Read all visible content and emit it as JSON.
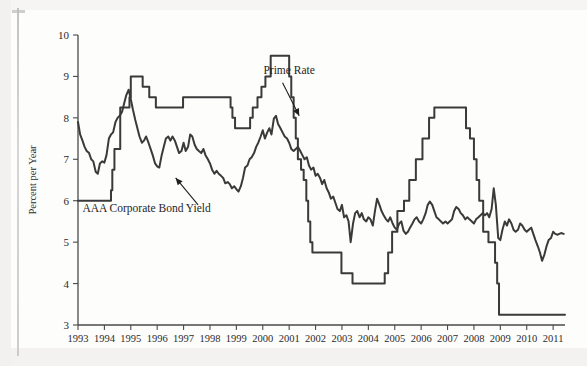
{
  "figure": {
    "background_color": "#fdfdfc",
    "line_color": "#3a3a3a",
    "axis_color": "#4a4a4a"
  },
  "annotations": [
    {
      "name": "prime-rate",
      "text": "Prime Rate",
      "x": 2001.0,
      "y": 9.05
    },
    {
      "name": "aaa-corporate-bond-yield",
      "text": "AAA Corporate Bond Yield",
      "x": 1995.6,
      "y": 5.72
    }
  ],
  "chart_data": {
    "type": "line",
    "title": "",
    "xlabel": "",
    "ylabel": "Percent per Year",
    "xlim": [
      1993.0,
      2011.45
    ],
    "ylim": [
      3,
      10
    ],
    "yticks": [
      3,
      4,
      5,
      6,
      7,
      8,
      9,
      10
    ],
    "xticks": [
      1993,
      1994,
      1995,
      1996,
      1997,
      1998,
      1999,
      2000,
      2001,
      2002,
      2003,
      2004,
      2005,
      2006,
      2007,
      2008,
      2009,
      2010,
      2011
    ],
    "xtick_labels": [
      "1993",
      "1994",
      "1995",
      "1996",
      "1997",
      "1998",
      "1999",
      "2000",
      "2001",
      "2002",
      "2003",
      "2004",
      "2005",
      "2006",
      "2007",
      "2008",
      "2009",
      "2010",
      "2011"
    ],
    "ytick_labels": [
      "3",
      "4",
      "5",
      "6",
      "7",
      "8",
      "9",
      "10"
    ],
    "grid": false,
    "legend_position": "none",
    "series": [
      {
        "name": "Prime Rate",
        "color": "#3a3a3a",
        "step": true,
        "points": [
          [
            1993.0,
            6.0
          ],
          [
            1994.2,
            6.0
          ],
          [
            1994.25,
            6.25
          ],
          [
            1994.3,
            6.75
          ],
          [
            1994.38,
            7.25
          ],
          [
            1994.55,
            7.25
          ],
          [
            1994.6,
            8.25
          ],
          [
            1994.8,
            8.25
          ],
          [
            1994.95,
            8.5
          ],
          [
            1995.0,
            9.0
          ],
          [
            1995.38,
            9.0
          ],
          [
            1995.45,
            8.75
          ],
          [
            1995.6,
            8.75
          ],
          [
            1995.7,
            8.5
          ],
          [
            1995.85,
            8.5
          ],
          [
            1995.95,
            8.25
          ],
          [
            1996.9,
            8.25
          ],
          [
            1996.98,
            8.5
          ],
          [
            1998.7,
            8.5
          ],
          [
            1998.78,
            8.25
          ],
          [
            1998.85,
            8.0
          ],
          [
            1998.95,
            7.75
          ],
          [
            1999.45,
            7.75
          ],
          [
            1999.52,
            8.0
          ],
          [
            1999.62,
            8.25
          ],
          [
            1999.8,
            8.5
          ],
          [
            1999.95,
            8.75
          ],
          [
            2000.1,
            9.0
          ],
          [
            2000.3,
            9.5
          ],
          [
            2000.42,
            9.5
          ],
          [
            2000.9,
            9.5
          ],
          [
            2001.0,
            9.0
          ],
          [
            2001.08,
            8.5
          ],
          [
            2001.17,
            8.0
          ],
          [
            2001.25,
            7.5
          ],
          [
            2001.33,
            7.0
          ],
          [
            2001.45,
            6.75
          ],
          [
            2001.55,
            6.5
          ],
          [
            2001.65,
            6.0
          ],
          [
            2001.72,
            5.5
          ],
          [
            2001.8,
            5.0
          ],
          [
            2001.88,
            4.75
          ],
          [
            2002.9,
            4.75
          ],
          [
            2002.98,
            4.25
          ],
          [
            2003.3,
            4.25
          ],
          [
            2003.4,
            4.0
          ],
          [
            2004.55,
            4.0
          ],
          [
            2004.62,
            4.25
          ],
          [
            2004.75,
            4.75
          ],
          [
            2004.9,
            5.25
          ],
          [
            2005.1,
            5.75
          ],
          [
            2005.35,
            6.0
          ],
          [
            2005.55,
            6.5
          ],
          [
            2005.8,
            7.0
          ],
          [
            2006.05,
            7.5
          ],
          [
            2006.3,
            8.0
          ],
          [
            2006.5,
            8.25
          ],
          [
            2007.6,
            8.25
          ],
          [
            2007.7,
            7.75
          ],
          [
            2007.85,
            7.5
          ],
          [
            2008.0,
            7.0
          ],
          [
            2008.1,
            6.5
          ],
          [
            2008.2,
            6.0
          ],
          [
            2008.35,
            5.25
          ],
          [
            2008.55,
            5.0
          ],
          [
            2008.72,
            5.0
          ],
          [
            2008.8,
            4.5
          ],
          [
            2008.88,
            4.0
          ],
          [
            2008.95,
            3.25
          ],
          [
            2011.45,
            3.25
          ]
        ]
      },
      {
        "name": "AAA Corporate Bond Yield",
        "color": "#3a3a3a",
        "step": false,
        "points": [
          [
            1993.0,
            7.9
          ],
          [
            1993.08,
            7.6
          ],
          [
            1993.17,
            7.45
          ],
          [
            1993.25,
            7.3
          ],
          [
            1993.33,
            7.2
          ],
          [
            1993.42,
            7.15
          ],
          [
            1993.5,
            7.0
          ],
          [
            1993.58,
            6.95
          ],
          [
            1993.67,
            6.7
          ],
          [
            1993.75,
            6.65
          ],
          [
            1993.83,
            6.9
          ],
          [
            1993.92,
            6.95
          ],
          [
            1994.0,
            6.92
          ],
          [
            1994.08,
            7.1
          ],
          [
            1994.17,
            7.5
          ],
          [
            1994.25,
            7.6
          ],
          [
            1994.33,
            7.65
          ],
          [
            1994.42,
            7.9
          ],
          [
            1994.5,
            8.0
          ],
          [
            1994.58,
            8.05
          ],
          [
            1994.67,
            8.15
          ],
          [
            1994.75,
            8.35
          ],
          [
            1994.83,
            8.55
          ],
          [
            1994.92,
            8.68
          ],
          [
            1995.0,
            8.45
          ],
          [
            1995.08,
            8.2
          ],
          [
            1995.17,
            7.95
          ],
          [
            1995.25,
            7.75
          ],
          [
            1995.33,
            7.55
          ],
          [
            1995.42,
            7.4
          ],
          [
            1995.5,
            7.45
          ],
          [
            1995.58,
            7.55
          ],
          [
            1995.67,
            7.4
          ],
          [
            1995.75,
            7.25
          ],
          [
            1995.83,
            7.1
          ],
          [
            1995.92,
            6.9
          ],
          [
            1996.0,
            6.83
          ],
          [
            1996.08,
            6.8
          ],
          [
            1996.17,
            7.1
          ],
          [
            1996.25,
            7.3
          ],
          [
            1996.33,
            7.5
          ],
          [
            1996.42,
            7.55
          ],
          [
            1996.5,
            7.45
          ],
          [
            1996.58,
            7.55
          ],
          [
            1996.67,
            7.45
          ],
          [
            1996.75,
            7.3
          ],
          [
            1996.83,
            7.15
          ],
          [
            1996.92,
            7.2
          ],
          [
            1997.0,
            7.4
          ],
          [
            1997.08,
            7.2
          ],
          [
            1997.17,
            7.3
          ],
          [
            1997.25,
            7.6
          ],
          [
            1997.33,
            7.55
          ],
          [
            1997.42,
            7.35
          ],
          [
            1997.5,
            7.25
          ],
          [
            1997.58,
            7.2
          ],
          [
            1997.67,
            7.15
          ],
          [
            1997.75,
            7.25
          ],
          [
            1997.83,
            7.1
          ],
          [
            1997.92,
            7.0
          ],
          [
            1998.0,
            6.9
          ],
          [
            1998.08,
            6.75
          ],
          [
            1998.17,
            6.65
          ],
          [
            1998.25,
            6.72
          ],
          [
            1998.33,
            6.65
          ],
          [
            1998.42,
            6.6
          ],
          [
            1998.5,
            6.55
          ],
          [
            1998.58,
            6.42
          ],
          [
            1998.67,
            6.45
          ],
          [
            1998.75,
            6.4
          ],
          [
            1998.83,
            6.3
          ],
          [
            1998.92,
            6.35
          ],
          [
            1999.0,
            6.28
          ],
          [
            1999.08,
            6.22
          ],
          [
            1999.17,
            6.35
          ],
          [
            1999.25,
            6.55
          ],
          [
            1999.33,
            6.8
          ],
          [
            1999.42,
            6.85
          ],
          [
            1999.5,
            7.0
          ],
          [
            1999.58,
            7.05
          ],
          [
            1999.67,
            7.15
          ],
          [
            1999.75,
            7.3
          ],
          [
            1999.83,
            7.4
          ],
          [
            1999.92,
            7.55
          ],
          [
            2000.0,
            7.7
          ],
          [
            2000.08,
            7.5
          ],
          [
            2000.17,
            7.65
          ],
          [
            2000.25,
            7.75
          ],
          [
            2000.33,
            7.6
          ],
          [
            2000.42,
            7.98
          ],
          [
            2000.5,
            8.05
          ],
          [
            2000.58,
            7.85
          ],
          [
            2000.67,
            7.75
          ],
          [
            2000.75,
            7.65
          ],
          [
            2000.83,
            7.55
          ],
          [
            2000.92,
            7.5
          ],
          [
            2001.0,
            7.4
          ],
          [
            2001.08,
            7.25
          ],
          [
            2001.17,
            7.2
          ],
          [
            2001.25,
            7.25
          ],
          [
            2001.33,
            7.3
          ],
          [
            2001.42,
            7.2
          ],
          [
            2001.5,
            7.1
          ],
          [
            2001.58,
            7.0
          ],
          [
            2001.67,
            7.05
          ],
          [
            2001.75,
            6.85
          ],
          [
            2001.83,
            6.75
          ],
          [
            2001.92,
            6.8
          ],
          [
            2002.0,
            6.6
          ],
          [
            2002.08,
            6.65
          ],
          [
            2002.17,
            6.55
          ],
          [
            2002.25,
            6.4
          ],
          [
            2002.33,
            6.5
          ],
          [
            2002.42,
            6.3
          ],
          [
            2002.5,
            6.2
          ],
          [
            2002.58,
            6.05
          ],
          [
            2002.67,
            6.1
          ],
          [
            2002.75,
            5.95
          ],
          [
            2002.83,
            5.8
          ],
          [
            2002.92,
            5.75
          ],
          [
            2003.0,
            5.9
          ],
          [
            2003.08,
            5.6
          ],
          [
            2003.17,
            5.65
          ],
          [
            2003.25,
            5.5
          ],
          [
            2003.33,
            5.0
          ],
          [
            2003.42,
            5.45
          ],
          [
            2003.5,
            5.7
          ],
          [
            2003.58,
            5.75
          ],
          [
            2003.67,
            5.6
          ],
          [
            2003.75,
            5.7
          ],
          [
            2003.83,
            5.55
          ],
          [
            2003.92,
            5.5
          ],
          [
            2004.0,
            5.6
          ],
          [
            2004.08,
            5.55
          ],
          [
            2004.17,
            5.4
          ],
          [
            2004.25,
            5.75
          ],
          [
            2004.33,
            6.05
          ],
          [
            2004.42,
            5.9
          ],
          [
            2004.5,
            5.75
          ],
          [
            2004.58,
            5.65
          ],
          [
            2004.67,
            5.55
          ],
          [
            2004.75,
            5.5
          ],
          [
            2004.83,
            5.6
          ],
          [
            2004.92,
            5.45
          ],
          [
            2005.0,
            5.35
          ],
          [
            2005.08,
            5.3
          ],
          [
            2005.17,
            5.45
          ],
          [
            2005.25,
            5.5
          ],
          [
            2005.33,
            5.28
          ],
          [
            2005.42,
            5.2
          ],
          [
            2005.5,
            5.25
          ],
          [
            2005.58,
            5.35
          ],
          [
            2005.67,
            5.45
          ],
          [
            2005.75,
            5.55
          ],
          [
            2005.83,
            5.6
          ],
          [
            2005.92,
            5.5
          ],
          [
            2006.0,
            5.45
          ],
          [
            2006.08,
            5.55
          ],
          [
            2006.17,
            5.7
          ],
          [
            2006.25,
            5.9
          ],
          [
            2006.33,
            5.98
          ],
          [
            2006.42,
            5.9
          ],
          [
            2006.5,
            5.75
          ],
          [
            2006.58,
            5.6
          ],
          [
            2006.67,
            5.55
          ],
          [
            2006.75,
            5.5
          ],
          [
            2006.83,
            5.45
          ],
          [
            2006.92,
            5.5
          ],
          [
            2007.0,
            5.45
          ],
          [
            2007.08,
            5.5
          ],
          [
            2007.17,
            5.55
          ],
          [
            2007.25,
            5.75
          ],
          [
            2007.33,
            5.85
          ],
          [
            2007.42,
            5.8
          ],
          [
            2007.5,
            5.7
          ],
          [
            2007.58,
            5.65
          ],
          [
            2007.67,
            5.55
          ],
          [
            2007.75,
            5.6
          ],
          [
            2007.83,
            5.55
          ],
          [
            2007.92,
            5.5
          ],
          [
            2008.0,
            5.45
          ],
          [
            2008.08,
            5.55
          ],
          [
            2008.17,
            5.6
          ],
          [
            2008.25,
            5.65
          ],
          [
            2008.33,
            5.7
          ],
          [
            2008.42,
            5.65
          ],
          [
            2008.5,
            5.7
          ],
          [
            2008.58,
            5.6
          ],
          [
            2008.67,
            5.8
          ],
          [
            2008.75,
            6.3
          ],
          [
            2008.83,
            5.9
          ],
          [
            2008.92,
            5.1
          ],
          [
            2009.0,
            5.05
          ],
          [
            2009.08,
            5.3
          ],
          [
            2009.17,
            5.5
          ],
          [
            2009.25,
            5.4
          ],
          [
            2009.33,
            5.55
          ],
          [
            2009.42,
            5.45
          ],
          [
            2009.5,
            5.3
          ],
          [
            2009.58,
            5.25
          ],
          [
            2009.67,
            5.3
          ],
          [
            2009.75,
            5.45
          ],
          [
            2009.83,
            5.4
          ],
          [
            2009.92,
            5.3
          ],
          [
            2010.0,
            5.25
          ],
          [
            2010.08,
            5.3
          ],
          [
            2010.17,
            5.35
          ],
          [
            2010.25,
            5.2
          ],
          [
            2010.33,
            5.05
          ],
          [
            2010.42,
            4.9
          ],
          [
            2010.5,
            4.75
          ],
          [
            2010.58,
            4.55
          ],
          [
            2010.67,
            4.7
          ],
          [
            2010.75,
            4.9
          ],
          [
            2010.83,
            5.05
          ],
          [
            2010.92,
            5.1
          ],
          [
            2011.0,
            5.25
          ],
          [
            2011.08,
            5.2
          ],
          [
            2011.17,
            5.18
          ],
          [
            2011.3,
            5.22
          ],
          [
            2011.4,
            5.2
          ]
        ]
      }
    ]
  }
}
